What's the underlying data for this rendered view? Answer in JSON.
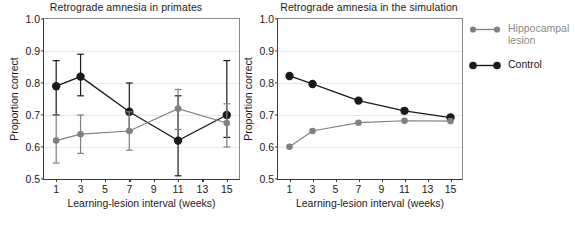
{
  "figure": {
    "xlabel": "Learning-lesion interval (weeks)",
    "ylabel": "Proportion correct",
    "ylim": [
      0.5,
      1.0
    ],
    "yticks": [
      "0.5",
      "0.6",
      "0.7",
      "0.8",
      "0.9",
      "1.0"
    ],
    "xticks": [
      "1",
      "3",
      "5",
      "7",
      "9",
      "11",
      "13",
      "15"
    ],
    "colors": {
      "control": "#1a1a1a",
      "lesion": "#808080",
      "grid": "#e8e8e8",
      "axis": "#3a3a3a"
    }
  },
  "legend": {
    "position": "right",
    "entries": [
      {
        "label": "Hippocampal\nlesion",
        "color": "#808080",
        "name": "hippocampal-lesion"
      },
      {
        "label": "Control",
        "color": "#1a1a1a",
        "name": "control"
      }
    ]
  },
  "chart_data": [
    {
      "type": "line",
      "panel": "left",
      "title": "Retrograde amnesia in primates",
      "xlabel": "Learning-lesion interval (weeks)",
      "ylabel": "Proportion correct",
      "x": [
        1,
        3,
        7,
        11,
        15
      ],
      "xlim": [
        0,
        16
      ],
      "ylim": [
        0.5,
        1.0
      ],
      "grid": true,
      "errorbars": true,
      "series": [
        {
          "name": "Control",
          "color": "#1a1a1a",
          "values": [
            0.79,
            0.82,
            0.71,
            0.62,
            0.7
          ],
          "err_low": [
            0.7,
            0.76,
            0.65,
            0.51,
            0.63
          ],
          "err_high": [
            0.87,
            0.89,
            0.8,
            0.76,
            0.87
          ]
        },
        {
          "name": "Hippocampal lesion",
          "color": "#808080",
          "values": [
            0.62,
            0.64,
            0.65,
            0.72,
            0.675
          ],
          "err_low": [
            0.55,
            0.58,
            0.59,
            0.655,
            0.6
          ],
          "err_high": [
            0.7,
            0.7,
            0.71,
            0.78,
            0.735
          ]
        }
      ]
    },
    {
      "type": "line",
      "panel": "right",
      "title": "Retrograde amnesia in the simulation",
      "xlabel": "Learning-lesion interval (weeks)",
      "ylabel": "Proportion correct",
      "x": [
        1,
        3,
        7,
        11,
        15
      ],
      "xlim": [
        0,
        16
      ],
      "ylim": [
        0.5,
        1.0
      ],
      "grid": true,
      "errorbars": false,
      "series": [
        {
          "name": "Control",
          "color": "#1a1a1a",
          "values": [
            0.822,
            0.797,
            0.745,
            0.713,
            0.692
          ]
        },
        {
          "name": "Hippocampal lesion",
          "color": "#808080",
          "values": [
            0.601,
            0.65,
            0.676,
            0.682,
            0.681
          ]
        }
      ]
    }
  ]
}
